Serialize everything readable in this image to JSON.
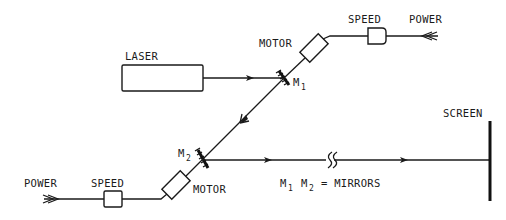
{
  "diagram": {
    "type": "optical-apparatus-schematic",
    "labels": {
      "laser": "LASER",
      "motor_top": "MOTOR",
      "speed_top": "SPEED",
      "power_top": "POWER",
      "mirror1_M": "M",
      "mirror1_sub": "1",
      "mirror2_M": "M",
      "mirror2_sub": "2",
      "motor_bottom": "MOTOR",
      "speed_bottom": "SPEED",
      "power_bottom": "POWER",
      "screen": "SCREEN",
      "legend_m1": "M",
      "legend_m1_sub": "1",
      "legend_m2": "M",
      "legend_m2_sub": "2",
      "legend_rest": "= MIRRORS"
    },
    "components": [
      {
        "name": "laser",
        "shape": "rectangle"
      },
      {
        "name": "mirror-1",
        "shape": "hatched-mirror"
      },
      {
        "name": "mirror-2",
        "shape": "hatched-mirror"
      },
      {
        "name": "motor-top",
        "shape": "rotated-rectangle"
      },
      {
        "name": "motor-bottom",
        "shape": "rotated-rectangle"
      },
      {
        "name": "speed-control-top",
        "shape": "small-box"
      },
      {
        "name": "speed-control-bottom",
        "shape": "small-box"
      },
      {
        "name": "screen",
        "shape": "thick-vertical-line"
      }
    ],
    "beam_path": [
      "laser",
      "mirror-1",
      "mirror-2",
      "screen"
    ],
    "break_mark": true,
    "colors": {
      "ink": "#1a1a1a",
      "background": "#ffffff"
    }
  }
}
